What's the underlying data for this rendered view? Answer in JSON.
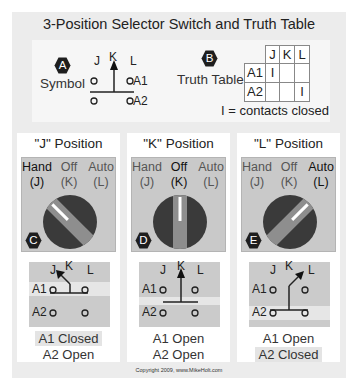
{
  "title": "3-Position Selector Switch and Truth Table",
  "symbol_section": {
    "badge": "A",
    "label": "Symbol",
    "positions": [
      "J",
      "K",
      "L"
    ],
    "contacts": [
      "A1",
      "A2"
    ]
  },
  "truth_table_section": {
    "badge": "B",
    "label": "Truth Table",
    "columns": [
      "J",
      "K",
      "L"
    ],
    "rows": [
      {
        "label": "A1",
        "cells": [
          "I",
          "",
          ""
        ]
      },
      {
        "label": "A2",
        "cells": [
          "",
          "",
          "I"
        ]
      }
    ],
    "legend": "I = contacts closed"
  },
  "panels": [
    {
      "title": "\"J\" Position",
      "badge": "C",
      "labels": [
        {
          "name": "Hand",
          "pos": "(J)"
        },
        {
          "name": "Off",
          "pos": "(K)"
        },
        {
          "name": "Auto",
          "pos": "(L)"
        }
      ],
      "active": 0,
      "diagram": {
        "J": "J",
        "K": "K",
        "L": "L",
        "A1": "A1",
        "A2": "A2"
      },
      "state_a1": "A1 Closed",
      "state_a2": "A2 Open"
    },
    {
      "title": "\"K\" Position",
      "badge": "D",
      "labels": [
        {
          "name": "Hand",
          "pos": "(J)"
        },
        {
          "name": "Off",
          "pos": "(K)"
        },
        {
          "name": "Auto",
          "pos": "(L)"
        }
      ],
      "active": 1,
      "diagram": {
        "J": "J",
        "K": "K",
        "L": "L",
        "A1": "A1",
        "A2": "A2"
      },
      "state_a1": "A1 Open",
      "state_a2": "A2 Open"
    },
    {
      "title": "\"L\" Position",
      "badge": "E",
      "labels": [
        {
          "name": "Hand",
          "pos": "(J)"
        },
        {
          "name": "Off",
          "pos": "(K)"
        },
        {
          "name": "Auto",
          "pos": "(L)"
        }
      ],
      "active": 2,
      "diagram": {
        "J": "J",
        "K": "K",
        "L": "L",
        "A1": "A1",
        "A2": "A2"
      },
      "state_a1": "A1 Open",
      "state_a2": "A2 Closed"
    }
  ],
  "colors": {
    "frame": "#ececec",
    "knob_body": "#3a3a3a",
    "knob_stripe": "#8e8e8e",
    "badge": "#1e1e1e",
    "gray_box": "#c9c9c9"
  },
  "copyright": "Copyright 2009, www.MikeHolt.com"
}
